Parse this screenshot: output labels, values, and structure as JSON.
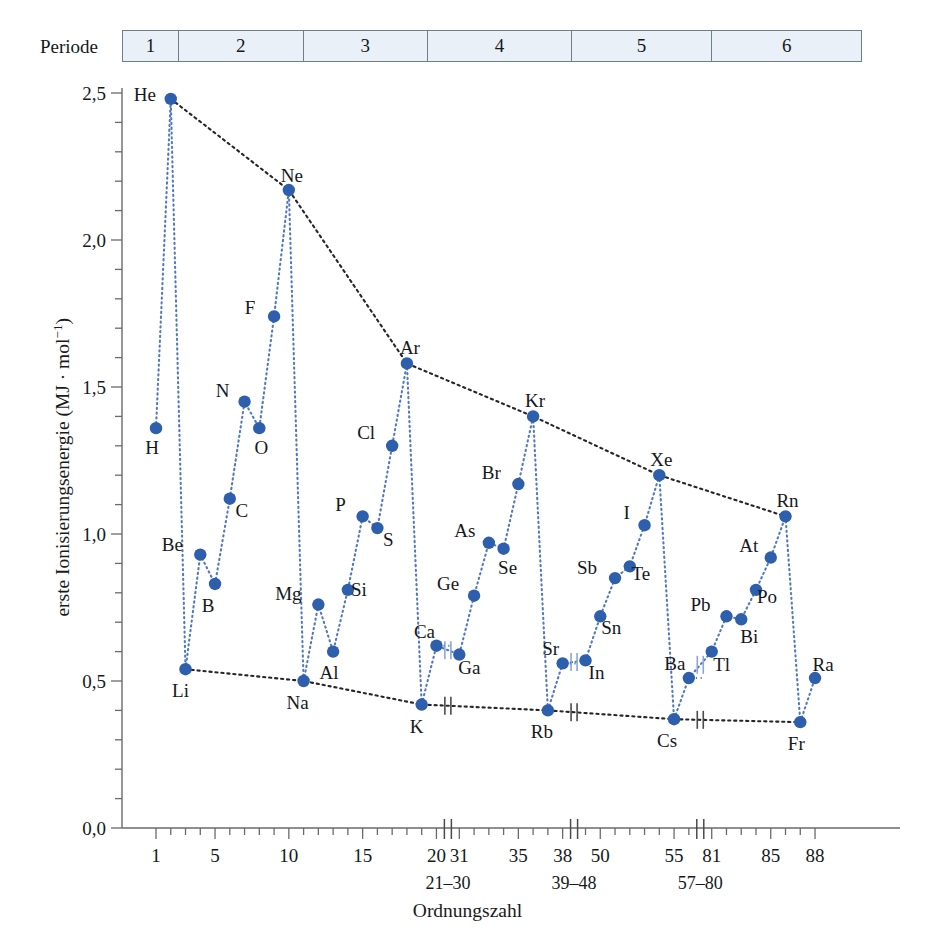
{
  "header": {
    "period_label": "Periode",
    "periods": [
      {
        "num": "1",
        "x0": 122,
        "x1": 178
      },
      {
        "num": "2",
        "x0": 178,
        "x1": 303
      },
      {
        "num": "3",
        "x0": 303,
        "x1": 428
      },
      {
        "num": "4",
        "x0": 428,
        "x1": 572
      },
      {
        "num": "5",
        "x0": 572,
        "x1": 713
      },
      {
        "num": "6",
        "x0": 713,
        "x1": 862
      }
    ]
  },
  "chart_data": {
    "type": "line",
    "title": "",
    "xlabel": "Ordnungszahl",
    "ylabel": "erste Ionisierungsenergie (MJ · mol⁻¹)",
    "ylim": [
      0.0,
      2.5
    ],
    "ytick_major": [
      "0,0",
      "0,5",
      "1,0",
      "1,5",
      "2,0",
      "2,5"
    ],
    "ytick_major_values": [
      0.0,
      0.5,
      1.0,
      1.5,
      2.0,
      2.5
    ],
    "ytick_minor_step": 0.1,
    "xtick_labels": [
      "1",
      "5",
      "10",
      "15",
      "20",
      "31",
      "35",
      "38",
      "50",
      "55",
      "81",
      "85",
      "88"
    ],
    "xtick_values": [
      1,
      5,
      10,
      15,
      20,
      31,
      35,
      38,
      50,
      55,
      81,
      85,
      88
    ],
    "axis_breaks": [
      "21–30",
      "39–48",
      "57–80"
    ],
    "axis_break_positions": [
      22.5,
      38.5,
      56.5
    ],
    "grid": false,
    "legend": "none",
    "marker_color": "#2E5FAC",
    "series_line_color": "#5478C0",
    "envelope_line_color": "#25262a",
    "points": [
      {
        "el": "H",
        "z": 1,
        "v": 1.36,
        "lx": -4,
        "ly": 26
      },
      {
        "el": "He",
        "z": 2,
        "v": 2.48,
        "lx": -26,
        "ly": 2
      },
      {
        "el": "Li",
        "z": 3,
        "v": 0.54,
        "lx": -5,
        "ly": 28
      },
      {
        "el": "Be",
        "z": 4,
        "v": 0.93,
        "lx": -28,
        "ly": -4
      },
      {
        "el": "B",
        "z": 5,
        "v": 0.83,
        "lx": -7,
        "ly": 28
      },
      {
        "el": "C",
        "z": 6,
        "v": 1.12,
        "lx": 12,
        "ly": 18
      },
      {
        "el": "N",
        "z": 7,
        "v": 1.45,
        "lx": -22,
        "ly": -5
      },
      {
        "el": "O",
        "z": 8,
        "v": 1.36,
        "lx": 2,
        "ly": 26
      },
      {
        "el": "F",
        "z": 9,
        "v": 1.74,
        "lx": -24,
        "ly": -2
      },
      {
        "el": "Ne",
        "z": 10,
        "v": 2.17,
        "lx": 3,
        "ly": -8
      },
      {
        "el": "Na",
        "z": 11,
        "v": 0.5,
        "lx": -6,
        "ly": 28
      },
      {
        "el": "Mg",
        "z": 12,
        "v": 0.76,
        "lx": -30,
        "ly": -5
      },
      {
        "el": "Al",
        "z": 13,
        "v": 0.6,
        "lx": -4,
        "ly": 27
      },
      {
        "el": "Si",
        "z": 14,
        "v": 0.81,
        "lx": 11,
        "ly": 6
      },
      {
        "el": "P",
        "z": 15,
        "v": 1.06,
        "lx": -22,
        "ly": -5
      },
      {
        "el": "S",
        "z": 16,
        "v": 1.02,
        "lx": 11,
        "ly": 18
      },
      {
        "el": "Cl",
        "z": 17,
        "v": 1.3,
        "lx": -26,
        "ly": -7
      },
      {
        "el": "Ar",
        "z": 18,
        "v": 1.58,
        "lx": 3,
        "ly": -9
      },
      {
        "el": "K",
        "z": 19,
        "v": 0.42,
        "lx": -5,
        "ly": 28
      },
      {
        "el": "Ca",
        "z": 20,
        "v": 0.62,
        "lx": -12,
        "ly": -8
      },
      {
        "el": "Ga",
        "z": 31,
        "v": 0.59,
        "lx": 10,
        "ly": 19
      },
      {
        "el": "Ge",
        "z": 32,
        "v": 0.79,
        "lx": -26,
        "ly": -6
      },
      {
        "el": "As",
        "z": 33,
        "v": 0.97,
        "lx": -24,
        "ly": -6
      },
      {
        "el": "Se",
        "z": 34,
        "v": 0.95,
        "lx": 4,
        "ly": 25
      },
      {
        "el": "Br",
        "z": 35,
        "v": 1.17,
        "lx": -27,
        "ly": -5
      },
      {
        "el": "Kr",
        "z": 36,
        "v": 1.4,
        "lx": 2,
        "ly": -9
      },
      {
        "el": "Rb",
        "z": 37,
        "v": 0.4,
        "lx": -6,
        "ly": 28
      },
      {
        "el": "Sr",
        "z": 38,
        "v": 0.56,
        "lx": -12,
        "ly": -8
      },
      {
        "el": "In",
        "z": 49,
        "v": 0.57,
        "lx": 11,
        "ly": 19
      },
      {
        "el": "Sn",
        "z": 50,
        "v": 0.72,
        "lx": 11,
        "ly": 18
      },
      {
        "el": "Sb",
        "z": 51,
        "v": 0.85,
        "lx": -28,
        "ly": -4
      },
      {
        "el": "Te",
        "z": 52,
        "v": 0.89,
        "lx": 11,
        "ly": 14
      },
      {
        "el": "I",
        "z": 53,
        "v": 1.03,
        "lx": -18,
        "ly": -6
      },
      {
        "el": "Xe",
        "z": 54,
        "v": 1.2,
        "lx": 2,
        "ly": -9
      },
      {
        "el": "Cs",
        "z": 55,
        "v": 0.37,
        "lx": -7,
        "ly": 28
      },
      {
        "el": "Ba",
        "z": 56,
        "v": 0.51,
        "lx": -14,
        "ly": -8
      },
      {
        "el": "Tl",
        "z": 81,
        "v": 0.6,
        "lx": 10,
        "ly": 19
      },
      {
        "el": "Pb",
        "z": 82,
        "v": 0.72,
        "lx": -26,
        "ly": -5
      },
      {
        "el": "Bi",
        "z": 83,
        "v": 0.71,
        "lx": 8,
        "ly": 24
      },
      {
        "el": "Po",
        "z": 84,
        "v": 0.81,
        "lx": 11,
        "ly": 13
      },
      {
        "el": "At",
        "z": 85,
        "v": 0.92,
        "lx": -22,
        "ly": -6
      },
      {
        "el": "Rn",
        "z": 86,
        "v": 1.06,
        "lx": 2,
        "ly": -9
      },
      {
        "el": "Fr",
        "z": 87,
        "v": 0.36,
        "lx": -4,
        "ly": 28
      },
      {
        "el": "Ra",
        "z": 88,
        "v": 0.51,
        "lx": 8,
        "ly": -7
      }
    ],
    "period_series": [
      [
        "H",
        "He"
      ],
      [
        "Li",
        "Be",
        "B",
        "C",
        "N",
        "O",
        "F",
        "Ne"
      ],
      [
        "Na",
        "Mg",
        "Al",
        "Si",
        "P",
        "S",
        "Cl",
        "Ar"
      ],
      [
        "K",
        "Ca",
        "Ga",
        "Ge",
        "As",
        "Se",
        "Br",
        "Kr"
      ],
      [
        "Rb",
        "Sr",
        "In",
        "Sn",
        "Sb",
        "Te",
        "I",
        "Xe"
      ],
      [
        "Cs",
        "Ba",
        "Tl",
        "Pb",
        "Bi",
        "Po",
        "At",
        "Rn"
      ],
      [
        "Fr",
        "Ra"
      ]
    ],
    "noble_envelope": [
      "He",
      "Ne",
      "Ar",
      "Kr",
      "Xe",
      "Rn"
    ],
    "alkali_envelope": [
      "Li",
      "Na",
      "K",
      "Rb",
      "Cs",
      "Fr"
    ],
    "vertical_drops": [
      [
        "He",
        "Li"
      ],
      [
        "Ne",
        "Na"
      ],
      [
        "Ar",
        "K"
      ],
      [
        "Kr",
        "Rb"
      ],
      [
        "Xe",
        "Cs"
      ],
      [
        "Rn",
        "Fr"
      ]
    ]
  }
}
